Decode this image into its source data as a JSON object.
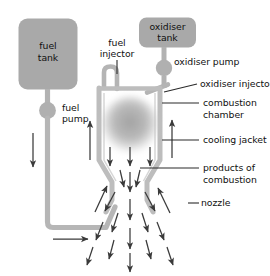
{
  "diagram": {
    "type": "cutaway cross-section",
    "colors": {
      "tank_fill": "#a8a8a8",
      "pipe": "#b4b4b4",
      "pipe_dark": "#9a9a9a",
      "combustion_blob": "#b0b0b0",
      "arrow": "#3a3a3a",
      "leader": "#2a2a2a",
      "text": "#101010",
      "background": "#ffffff"
    }
  },
  "labels": {
    "fuel_tank": "fuel\ntank",
    "fuel_tank_line1": "fuel",
    "fuel_tank_line2": "tank",
    "oxidiser_tank_line1": "oxidiser",
    "oxidiser_tank_line2": "tank",
    "fuel_pump_line1": "fuel",
    "fuel_pump_line2": "pump",
    "fuel_injector_line1": "fuel",
    "fuel_injector_line2": "injector",
    "oxidiser_pump": "oxidiser pump",
    "oxidiser_injector": "oxidiser injector",
    "combustion_chamber_line1": "combustion",
    "combustion_chamber_line2": "chamber",
    "cooling_jacket": "cooling jacket",
    "products_line1": "products of",
    "products_line2": "combustion",
    "nozzle": "nozzle"
  },
  "components": [
    {
      "name": "fuel-tank",
      "label": "fuel tank",
      "shape": "rounded-rectangle",
      "side": "left"
    },
    {
      "name": "oxidiser-tank",
      "label": "oxidiser tank",
      "shape": "rounded-rectangle",
      "side": "right"
    },
    {
      "name": "fuel-pump",
      "label": "fuel pump",
      "shape": "circle",
      "side": "left"
    },
    {
      "name": "oxidiser-pump",
      "label": "oxidiser pump",
      "shape": "circle",
      "side": "right"
    },
    {
      "name": "fuel-injector",
      "label": "fuel injector",
      "shape": "hooked-pipe"
    },
    {
      "name": "oxidiser-injector",
      "label": "oxidiser injector",
      "shape": "angled-pipe"
    },
    {
      "name": "combustion-chamber",
      "label": "combustion chamber",
      "shape": "chamber"
    },
    {
      "name": "cooling-jacket",
      "label": "cooling jacket",
      "shape": "wall-channel"
    },
    {
      "name": "nozzle",
      "label": "nozzle",
      "shape": "de-laval-bell"
    },
    {
      "name": "products-of-combustion",
      "label": "products of combustion",
      "shape": "arrow-field"
    }
  ],
  "flows": [
    {
      "name": "fuel-down-from-pump",
      "direction": "down",
      "side": "left"
    },
    {
      "name": "fuel-along-bottom",
      "direction": "right",
      "side": "bottom"
    },
    {
      "name": "fuel-up-cooling-jacket-left",
      "direction": "up"
    },
    {
      "name": "coolant-up-right-wall",
      "direction": "up"
    },
    {
      "name": "exhaust-out-nozzle",
      "direction": "down-and-outward"
    }
  ]
}
